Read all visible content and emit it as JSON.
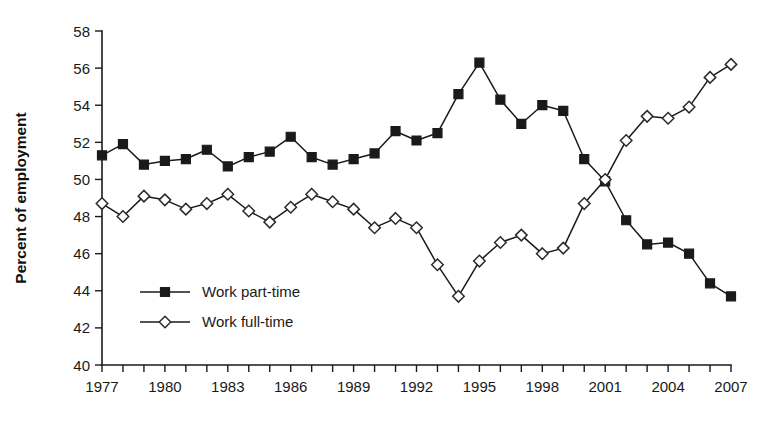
{
  "chart_data": {
    "type": "line",
    "title": "",
    "xlabel": "",
    "ylabel": "Percent of employment",
    "xlim": [
      1977,
      2007
    ],
    "ylim": [
      40,
      58
    ],
    "yticks": [
      40,
      42,
      44,
      46,
      48,
      50,
      52,
      54,
      56,
      58
    ],
    "ytick_labels": [
      "40",
      "42",
      "44",
      "46",
      "48",
      "50",
      "52",
      "54",
      "56",
      "58"
    ],
    "xticks": [
      1977,
      1978,
      1979,
      1980,
      1981,
      1982,
      1983,
      1984,
      1985,
      1986,
      1987,
      1988,
      1989,
      1990,
      1991,
      1992,
      1993,
      1994,
      1995,
      1996,
      1997,
      1998,
      1999,
      2000,
      2001,
      2002,
      2003,
      2004,
      2005,
      2006,
      2007
    ],
    "xtick_labels_shown": [
      "1977",
      "1980",
      "1983",
      "1986",
      "1989",
      "1992",
      "1995",
      "1998",
      "2001",
      "2004",
      "2007"
    ],
    "grid": false,
    "legend_position": "lower-left-inside",
    "x": [
      1977,
      1978,
      1979,
      1980,
      1981,
      1982,
      1983,
      1984,
      1985,
      1986,
      1987,
      1988,
      1989,
      1990,
      1991,
      1992,
      1993,
      1994,
      1995,
      1996,
      1997,
      1998,
      1999,
      2000,
      2001,
      2002,
      2003,
      2004,
      2005,
      2006,
      2007
    ],
    "series": [
      {
        "name": "Work part-time",
        "marker": "filled-square",
        "values": [
          51.3,
          51.9,
          50.8,
          51.0,
          51.1,
          51.6,
          50.7,
          51.2,
          51.5,
          52.3,
          51.2,
          50.8,
          51.1,
          51.4,
          52.6,
          52.1,
          52.5,
          54.6,
          56.3,
          54.3,
          53.0,
          54.0,
          53.7,
          51.1,
          49.9,
          47.8,
          46.5,
          46.6,
          46.0,
          44.4,
          43.7
        ]
      },
      {
        "name": "Work full-time",
        "marker": "open-diamond",
        "values": [
          48.7,
          48.0,
          49.1,
          48.9,
          48.4,
          48.7,
          49.2,
          48.3,
          47.7,
          48.5,
          49.2,
          48.8,
          48.4,
          47.4,
          47.9,
          47.4,
          45.4,
          43.7,
          45.6,
          46.6,
          47.0,
          46.0,
          46.3,
          48.7,
          50.0,
          52.1,
          53.4,
          53.3,
          53.9,
          55.5,
          56.2
        ]
      }
    ]
  },
  "legend": {
    "entries": [
      {
        "label": "Work part-time",
        "marker": "filled-square"
      },
      {
        "label": "Work full-time",
        "marker": "open-diamond"
      }
    ]
  },
  "axes": {
    "y_title": "Percent of employment"
  },
  "colors": {
    "foreground": "#1a1a1a",
    "background": "#ffffff",
    "series_part_time": "#1a1a1a",
    "series_full_time": "#ffffff"
  }
}
